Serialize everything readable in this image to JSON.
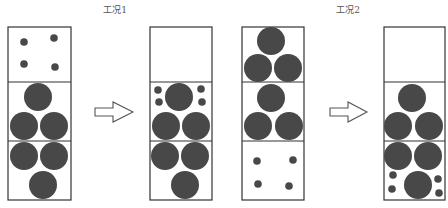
{
  "diagram": {
    "colors": {
      "particle": "#484848",
      "border": "#333333",
      "arrow": "#555555"
    },
    "cases": [
      {
        "title": "工况1",
        "before": {
          "cells": [
            {
              "content": "four small particles"
            },
            {
              "content": "three large particles (1 top, 2 bottom)"
            },
            {
              "content": "three large particles (2 top, 1 bottom)"
            }
          ]
        },
        "after": {
          "cells": [
            {
              "content": "empty"
            },
            {
              "content": "three large particles with four small particles filling gaps"
            },
            {
              "content": "three large particles (2 top, 1 bottom)"
            }
          ]
        }
      },
      {
        "title": "工况2",
        "before": {
          "cells": [
            {
              "content": "three large particles (1 top, 2 bottom)"
            },
            {
              "content": "three large particles (1 top, 2 bottom)"
            },
            {
              "content": "four small particles"
            }
          ]
        },
        "after": {
          "cells": [
            {
              "content": "empty"
            },
            {
              "content": "three large particles (1 top, 2 bottom)"
            },
            {
              "content": "three large particles with four small particles in bottom gaps"
            }
          ]
        }
      }
    ],
    "arrow_icon": "right-arrow-icon"
  }
}
